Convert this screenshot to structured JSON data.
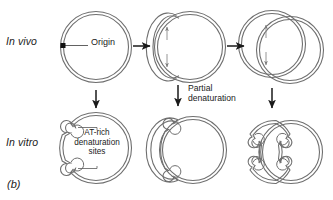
{
  "figure": {
    "panel_letter": "(b)",
    "row_labels": {
      "in_vivo": "In vivo",
      "in_vitro": "In vitro"
    },
    "annotations": {
      "origin": "Origin",
      "at_rich_sites": "AT-rich\ndenaturation\nsites",
      "partial_denaturation": "Partial\ndenaturation"
    },
    "colors": {
      "stroke": "#6f6f6f",
      "arrow": "#1a1a1a",
      "text": "#1a1a1a",
      "origin_marker": "#111111",
      "background": "#ffffff"
    },
    "stages": [
      {
        "name": "unreplicated-circle",
        "row": "in_vivo",
        "description": "circular duplex DNA with origin marker"
      },
      {
        "name": "early-replication-bubble",
        "row": "in_vivo",
        "description": "theta structure with small replication bubble and bidirectional fork arrows"
      },
      {
        "name": "late-replication-bubble",
        "row": "in_vivo",
        "description": "theta structure with large replication bubble and bidirectional fork arrows"
      },
      {
        "name": "denatured-circle",
        "row": "in_vitro",
        "description": "circle with two AT-rich denaturation bubbles"
      },
      {
        "name": "denatured-early-bubble",
        "row": "in_vitro",
        "description": "theta structure with denaturation bubbles on small replication loop"
      },
      {
        "name": "denatured-late-bubble",
        "row": "in_vitro",
        "description": "theta structure with many denaturation bubbles on large replication loop"
      }
    ],
    "arrows": [
      {
        "name": "arrow-right-stage1-stage2",
        "direction": "right"
      },
      {
        "name": "arrow-right-stage2-stage3",
        "direction": "right"
      },
      {
        "name": "arrow-down-stage1-stage4",
        "direction": "down"
      },
      {
        "name": "arrow-down-stage2-stage5",
        "direction": "down",
        "label": "Partial\ndenaturation"
      },
      {
        "name": "arrow-down-stage3-stage6",
        "direction": "down"
      }
    ]
  }
}
